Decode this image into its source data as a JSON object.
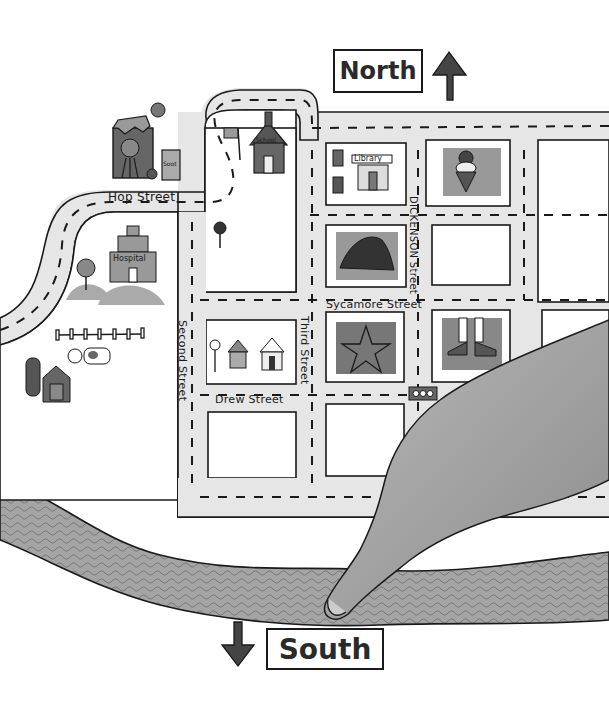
{
  "compass": {
    "north_label": "North",
    "south_label": "South"
  },
  "streets": {
    "hop": "Hop Street",
    "second": "Second Street",
    "third": "Third Street",
    "drew": "Drew Street",
    "sycamore": "Sycamore Street",
    "dickenson": "DICKENSON Street"
  },
  "buildings": {
    "library": "Library",
    "hospital": "Hospital",
    "school": "School",
    "factory_bin": "Soot"
  },
  "landmarks": [
    {
      "name": "factory",
      "icon": "factory-icon"
    },
    {
      "name": "school",
      "icon": "schoolhouse-icon"
    },
    {
      "name": "flag",
      "icon": "flag-icon"
    },
    {
      "name": "library",
      "icon": "library-icon"
    },
    {
      "name": "ice-cream-shop",
      "icon": "ice-cream-icon"
    },
    {
      "name": "hat-shop",
      "icon": "hat-icon"
    },
    {
      "name": "star-block",
      "icon": "star-icon"
    },
    {
      "name": "shoe-store",
      "icon": "boots-icon"
    },
    {
      "name": "houses",
      "icon": "house-icon"
    },
    {
      "name": "hospital",
      "icon": "hospital-icon"
    },
    {
      "name": "farm",
      "icon": "barn-icon"
    },
    {
      "name": "cow",
      "icon": "cow-icon"
    },
    {
      "name": "traffic-light",
      "icon": "traffic-light-icon"
    },
    {
      "name": "stop-sign",
      "icon": "stop-sign-icon"
    },
    {
      "name": "river",
      "icon": "river-icon"
    },
    {
      "name": "pointing-finger",
      "icon": "pointing-hand-icon"
    }
  ],
  "colors": {
    "road": "#e6e6e6",
    "ink": "#1a1a1a",
    "river": "#9a9a9a",
    "shade_dark": "#555555",
    "shade_mid": "#8a8a8a",
    "hand": "#a8a8a8"
  }
}
